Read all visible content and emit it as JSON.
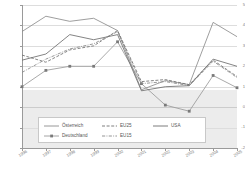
{
  "chart_data": {
    "type": "line",
    "title": "",
    "xlabel": "",
    "ylabel": "",
    "categories": [
      "1996",
      "1997",
      "1998",
      "1999",
      "2000",
      "2001",
      "2002",
      "2003",
      "2004",
      "2005"
    ],
    "x": [
      1996,
      1997,
      1998,
      1999,
      2000,
      2001,
      2002,
      2003,
      2004,
      2005
    ],
    "ylim": [
      -2,
      5
    ],
    "yticks": [
      5,
      4,
      3,
      2,
      1,
      0,
      -1,
      -2
    ],
    "ytick_labels": [
      "5",
      "4",
      "3",
      "2",
      "1",
      "0",
      "-1",
      "-2"
    ],
    "grid": true,
    "legend_position": "inside-bottom-center",
    "series": [
      {
        "name": "Österreich",
        "style": "solid",
        "marker": "none",
        "color": "#8c8c8c",
        "values": [
          3.7,
          4.45,
          4.2,
          4.35,
          3.75,
          0.85,
          1.3,
          1.1,
          4.15,
          3.45
        ]
      },
      {
        "name": "Deutschland",
        "style": "solid",
        "marker": "square",
        "color": "#9a9a9a",
        "values": [
          1.0,
          1.8,
          2.0,
          2.0,
          3.2,
          1.15,
          0.1,
          -0.2,
          1.55,
          0.95
        ]
      },
      {
        "name": "EU25",
        "style": "dashed",
        "marker": "none",
        "color": "#707070",
        "values": [
          2.55,
          2.2,
          2.8,
          3.0,
          3.75,
          1.25,
          1.35,
          1.1,
          2.3,
          1.5
        ]
      },
      {
        "name": "EU15",
        "style": "dashdot",
        "marker": "none",
        "color": "#888888",
        "values": [
          1.7,
          2.35,
          2.85,
          3.1,
          3.7,
          1.15,
          1.25,
          1.05,
          2.25,
          1.45
        ]
      },
      {
        "name": "USA",
        "style": "solid",
        "marker": "none",
        "color": "#6e6e6e",
        "values": [
          2.3,
          2.6,
          3.55,
          3.3,
          3.55,
          0.8,
          1.0,
          1.05,
          2.35,
          2.0
        ]
      }
    ]
  },
  "legend": {
    "entries": [
      {
        "label": "Österreich"
      },
      {
        "label": "EU25"
      },
      {
        "label": "Deutschland"
      },
      {
        "label": "EU15"
      },
      {
        "label": "USA"
      }
    ]
  },
  "colors": {
    "grid": "#dddddd",
    "axis": "#9a9a9a",
    "negative_band": "#ececec",
    "tick_text": "#808080"
  }
}
